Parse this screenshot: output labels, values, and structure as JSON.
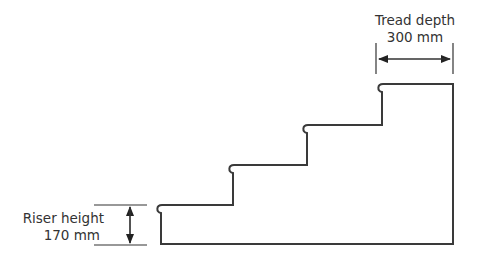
{
  "diagram": {
    "tread_label": "Tread depth",
    "tread_value": "300 mm",
    "riser_label": "Riser height",
    "riser_value": "170 mm",
    "colors": {
      "line": "#3a3a3a",
      "text": "#333333",
      "background": "#ffffff"
    },
    "steps": 4
  }
}
